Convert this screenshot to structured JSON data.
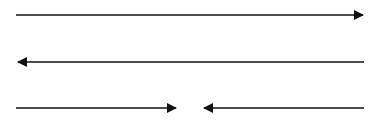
{
  "diagram": {
    "background": "#ffffff",
    "stroke_color": "#111111",
    "arrows": [
      {
        "name": "arrow-right-top",
        "x1": 16,
        "y1": 15,
        "x2": 365,
        "y2": 15,
        "head": "end"
      },
      {
        "name": "arrow-left-middle",
        "x1": 364,
        "y1": 62,
        "x2": 16,
        "y2": 62,
        "head": "end"
      },
      {
        "name": "arrow-right-bottom-left",
        "x1": 16,
        "y1": 108,
        "x2": 178,
        "y2": 108,
        "head": "end"
      },
      {
        "name": "arrow-left-bottom-right",
        "x1": 364,
        "y1": 108,
        "x2": 202,
        "y2": 108,
        "head": "end"
      }
    ]
  }
}
